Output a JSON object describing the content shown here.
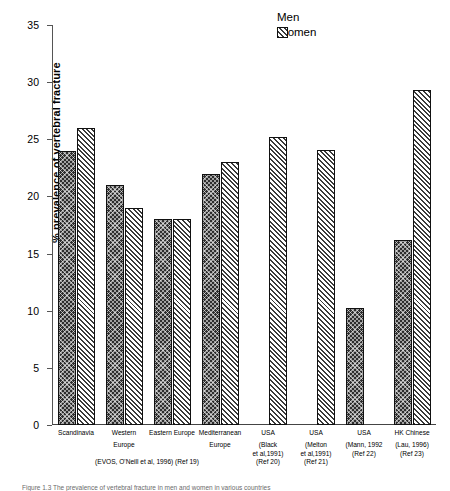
{
  "chart_data": {
    "type": "bar",
    "title": "",
    "xlabel": "",
    "ylabel": "% prevalence of vertebral fracture",
    "ylim": [
      0,
      35
    ],
    "yticks": [
      0,
      5,
      10,
      15,
      20,
      25,
      30,
      35
    ],
    "grid": false,
    "legend_position": "top-right",
    "categories": [
      "Scandinavia",
      "Western Europe",
      "Eastern Europe",
      "Mediterranean Europe",
      "USA (Black et al,1991) (Ref 20)",
      "USA (Melton et al,1991) (Ref 21)",
      "USA (Mann, 1992 (Ref 22)",
      "HK Chinese (Lau, 1996) (Ref 23)"
    ],
    "series": [
      {
        "name": "Men",
        "values": [
          24.0,
          21.0,
          18.0,
          22.0,
          null,
          null,
          10.2,
          16.2
        ]
      },
      {
        "name": "Women",
        "values": [
          26.0,
          19.0,
          18.0,
          23.0,
          25.2,
          24.1,
          null,
          29.3
        ]
      }
    ],
    "annotations": [
      "(EVOS, O'Neill et al, 1996) (Ref 19)"
    ]
  },
  "legend": {
    "items": [
      {
        "label": "Men",
        "pattern": "crosshatch-dark",
        "color": "#2e2e2e"
      },
      {
        "label": "Women",
        "pattern": "diagonal-light",
        "color": "#3a3a3a"
      }
    ]
  },
  "axis": {
    "y_title": "% prevalence of vertebral fracture",
    "y_ticks": [
      "0",
      "5",
      "10",
      "15",
      "20",
      "25",
      "30",
      "35"
    ]
  },
  "x_groups": [
    {
      "main": "Scandinavia",
      "sub": []
    },
    {
      "main": "Western",
      "sub": [
        "Europe"
      ]
    },
    {
      "main": "Eastern Europe",
      "sub": []
    },
    {
      "main": "Mediterranean",
      "sub": [
        "Europe"
      ]
    },
    {
      "main": "USA",
      "sub": [
        "(Black",
        "et al,1991)",
        "(Ref 20)"
      ]
    },
    {
      "main": "USA",
      "sub": [
        "(Melton",
        "et al,1991)",
        "(Ref 21)"
      ]
    },
    {
      "main": "USA",
      "sub": [
        "(Mann, 1992",
        "(Ref 22)"
      ]
    },
    {
      "main": "HK Chinese",
      "sub": [
        "(Lau, 1996)",
        "",
        "(Ref 23)"
      ]
    }
  ],
  "footnote": "(EVOS, O'Neill et al, 1996)  (Ref 19)",
  "caption": "Figure 1.3    The prevalence of vertebral fracture in men and women in various countries"
}
